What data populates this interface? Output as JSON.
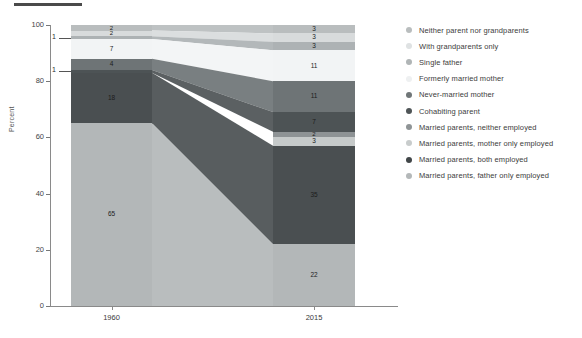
{
  "chart_data": {
    "type": "bar",
    "subtype": "stacked-alluvial",
    "title": "",
    "xlabel": "",
    "ylabel": "Percent",
    "ylim": [
      0,
      100
    ],
    "yticks": [
      0,
      20,
      40,
      60,
      80,
      100
    ],
    "categories": [
      "1960",
      "2015"
    ],
    "grid": false,
    "legend_position": "right",
    "series": [
      {
        "name": "Neither parent nor grandparents",
        "color": "#b9bdbe",
        "values": [
          2,
          3
        ],
        "labels": [
          "2",
          "3"
        ]
      },
      {
        "name": "With grandparents only",
        "color": "#d8dbdc",
        "values": [
          2,
          3
        ],
        "labels": [
          "2",
          "3"
        ]
      },
      {
        "name": "Single father",
        "color": "#adb2b4",
        "values": [
          1,
          3
        ],
        "labels": [
          "1",
          "3"
        ]
      },
      {
        "name": "Formerly married mother",
        "color": "#f2f4f5",
        "values": [
          7,
          11
        ],
        "labels": [
          "7",
          "11"
        ]
      },
      {
        "name": "Never-married mother",
        "color": "#6e7476",
        "values": [
          4,
          11
        ],
        "labels": [
          "4",
          "11"
        ]
      },
      {
        "name": "Cohabiting parent",
        "color": "#4d5355",
        "values": [
          1,
          7
        ],
        "labels": [
          "1",
          "7"
        ]
      },
      {
        "name": "Married parents, neither employed",
        "color": "#8e9395",
        "values": [
          2,
          2
        ],
        "labels": [
          "2",
          "2"
        ]
      },
      {
        "name": "Married parents, mother only employed",
        "color": "#c6caca",
        "values": [
          2,
          3
        ],
        "labels": [
          "2",
          "3"
        ]
      },
      {
        "name": "Married parents, both employed",
        "color": "#4a4f51",
        "values": [
          18,
          35
        ],
        "labels": [
          "18",
          "35"
        ]
      },
      {
        "name": "Married parents, father only employed",
        "color": "#b3b7b8",
        "values": [
          65,
          22
        ],
        "labels": [
          "65",
          "22"
        ]
      }
    ],
    "bars": {
      "1960": {
        "stack_top_to_bottom": [
          {
            "name": "Neither parent nor grandparents",
            "value": 2,
            "label": "2"
          },
          {
            "name": "With grandparents only",
            "value": 2,
            "label": "2"
          },
          {
            "name": "Single father",
            "value": 1,
            "label": "1"
          },
          {
            "name": "Formerly married mother",
            "value": 7,
            "label": "7"
          },
          {
            "name": "Never-married mother",
            "value": 4,
            "label": "4"
          },
          {
            "name": "Cohabiting parent",
            "value": 1,
            "label": "1"
          },
          {
            "name": "Married parents, both employed",
            "value": 18,
            "label": "18"
          },
          {
            "name": "Married parents, father only employed",
            "value": 65,
            "label": "65"
          }
        ]
      },
      "2015": {
        "stack_top_to_bottom": [
          {
            "name": "Neither parent nor grandparents",
            "value": 3,
            "label": "3"
          },
          {
            "name": "With grandparents only",
            "value": 3,
            "label": "3"
          },
          {
            "name": "Single father",
            "value": 3,
            "label": "3"
          },
          {
            "name": "Formerly married mother",
            "value": 11,
            "label": "11"
          },
          {
            "name": "Never-married mother",
            "value": 11,
            "label": "11"
          },
          {
            "name": "Cohabiting parent",
            "value": 7,
            "label": "7"
          },
          {
            "name": "Married parents, neither employed",
            "value": 2,
            "label": "2"
          },
          {
            "name": "Married parents, mother only employed",
            "value": 3,
            "label": "3"
          },
          {
            "name": "Married parents, both employed",
            "value": 35,
            "label": "35"
          },
          {
            "name": "Married parents, father only employed",
            "value": 22,
            "label": "22"
          }
        ]
      }
    },
    "callouts": [
      {
        "text": "1",
        "series": "Single father",
        "bar": "1960"
      },
      {
        "text": "1",
        "series": "Cohabiting parent",
        "bar": "1960"
      }
    ]
  },
  "axis": {
    "ylabel": "Percent",
    "yticks": [
      "100",
      "80",
      "60",
      "40",
      "20",
      "0"
    ],
    "xticks": [
      "1960",
      "2015"
    ]
  },
  "legend": {
    "items": [
      {
        "label": "Neither parent nor grandparents",
        "color": "#b9bdbe"
      },
      {
        "label": "With grandparents only",
        "color": "#dfe2e3"
      },
      {
        "label": "Single father",
        "color": "#b0b5b6"
      },
      {
        "label": "Formerly married mother",
        "color": "#eef0f1"
      },
      {
        "label": "Never-married mother",
        "color": "#707678"
      },
      {
        "label": "Cohabiting parent",
        "color": "#4f5557"
      },
      {
        "label": "Married parents, neither employed",
        "color": "#8f9496"
      },
      {
        "label": "Married parents, mother only employed",
        "color": "#c8cccc"
      },
      {
        "label": "Married parents, both employed",
        "color": "#414648"
      },
      {
        "label": "Married parents, father only employed",
        "color": "#b4b8b9"
      }
    ]
  }
}
